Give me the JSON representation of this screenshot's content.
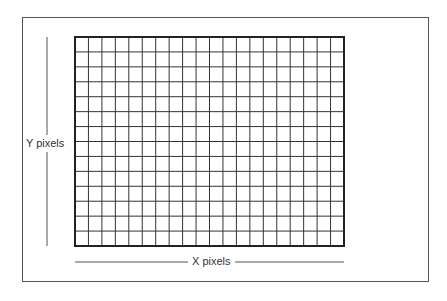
{
  "diagram": {
    "type": "pixel-grid",
    "grid": {
      "columns": 20,
      "rows": 14,
      "left": 75,
      "top": 37,
      "right": 344,
      "bottom": 246,
      "line_color": "#333333",
      "border_color": "#222222"
    },
    "labels": {
      "y_axis": "Y pixels",
      "x_axis": "X pixels"
    },
    "colors": {
      "background": "#ffffff",
      "frame": "#555555",
      "axis_line": "#555555"
    }
  }
}
